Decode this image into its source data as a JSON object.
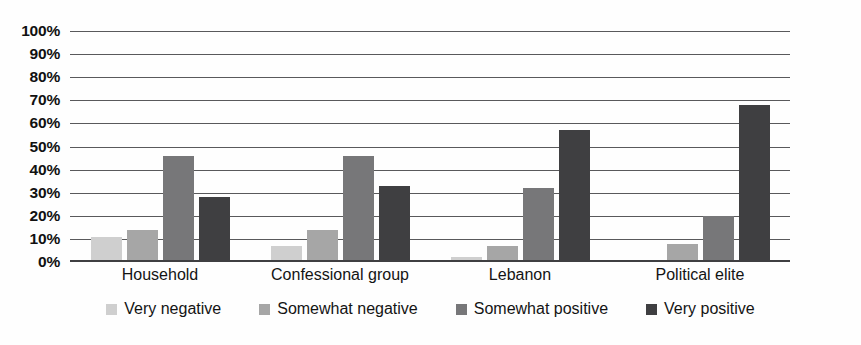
{
  "chart_data": {
    "type": "bar",
    "title": "",
    "subtitle": "",
    "xlabel": "",
    "ylabel": "",
    "categories": [
      "Household",
      "Confessional group",
      "Lebanon",
      "Political elite"
    ],
    "series": [
      {
        "name": "Very negative",
        "color": "#cfcfcf",
        "values": [
          11,
          7,
          2,
          1
        ]
      },
      {
        "name": "Somewhat negative",
        "color": "#a6a6a6",
        "values": [
          14,
          14,
          7,
          8
        ]
      },
      {
        "name": "Somewhat positive",
        "color": "#777779",
        "values": [
          46,
          46,
          32,
          20
        ]
      },
      {
        "name": "Very positive",
        "color": "#3f3f41",
        "values": [
          28,
          33,
          57,
          68
        ]
      }
    ],
    "ylim": [
      0,
      100
    ],
    "ytick_labels": [
      "100%",
      "90%",
      "80%",
      "70%",
      "60%",
      "50%",
      "40%",
      "30%",
      "20%",
      "10%",
      "0%"
    ],
    "ytick_values": [
      100,
      90,
      80,
      70,
      60,
      50,
      40,
      30,
      20,
      10,
      0
    ],
    "grid": true,
    "grid_color": "#59595b",
    "legend_position": "bottom",
    "background_color": "#ffffff",
    "value_suffix": "%"
  }
}
